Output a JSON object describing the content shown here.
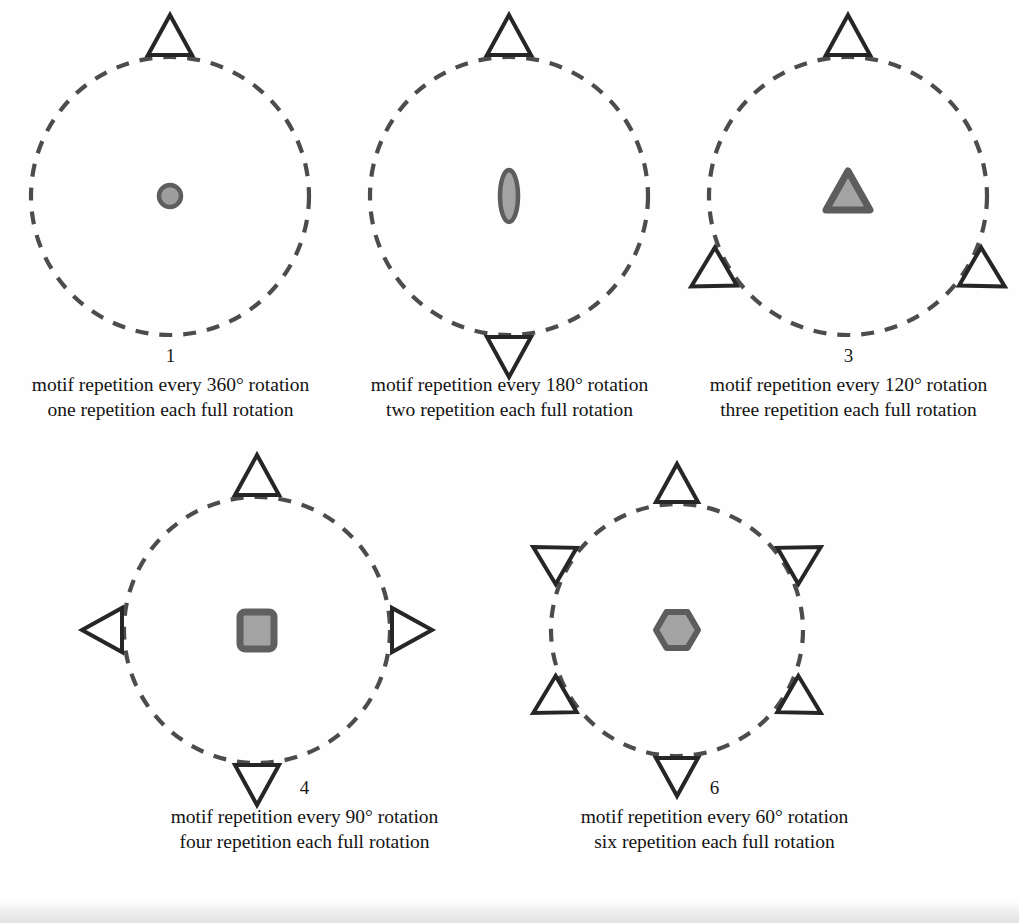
{
  "figure": {
    "palette": {
      "page_background": "#fefefe",
      "circle_stroke": "#4c4c4c",
      "motif_outline": "#262626",
      "center_shape_fill": "#9e9e9e",
      "center_shape_stroke": "#5d5d5d",
      "caption_text": "#131313",
      "bottom_band": "#e3e3e3"
    },
    "geometry": {
      "dash_pattern": "13 11",
      "circle_stroke_width": 4.2,
      "motif_outline_width": 4.0
    }
  },
  "panels": [
    {
      "id": "panel-1",
      "index_label": "1",
      "center_motif": "circle",
      "center_motif_icon": "filled-circle-icon",
      "fold_count": 1,
      "rotation_step_deg": 360,
      "marker_angles_deg": [
        0
      ],
      "caption_line_1": "motif repetition every 360° rotation",
      "caption_line_2": "one repetition each full rotation"
    },
    {
      "id": "panel-2",
      "index_label": "2",
      "center_motif": "ellipse",
      "center_motif_icon": "filled-ellipse-icon",
      "fold_count": 2,
      "rotation_step_deg": 180,
      "marker_angles_deg": [
        0,
        180
      ],
      "caption_line_1": "motif repetition every 180° rotation",
      "caption_line_2": "two repetition each full rotation"
    },
    {
      "id": "panel-3",
      "index_label": "3",
      "center_motif": "triangle",
      "center_motif_icon": "filled-triangle-icon",
      "fold_count": 3,
      "rotation_step_deg": 120,
      "marker_angles_deg": [
        0,
        120,
        240
      ],
      "caption_line_1": "motif repetition every 120° rotation",
      "caption_line_2": "three repetition each full rotation"
    },
    {
      "id": "panel-4",
      "index_label": "4",
      "center_motif": "square",
      "center_motif_icon": "filled-square-icon",
      "fold_count": 4,
      "rotation_step_deg": 90,
      "marker_angles_deg": [
        0,
        90,
        180,
        270
      ],
      "caption_line_1": "motif repetition every 90° rotation",
      "caption_line_2": "four repetition each full rotation"
    },
    {
      "id": "panel-6",
      "index_label": "6",
      "center_motif": "hexagon",
      "center_motif_icon": "filled-hexagon-icon",
      "fold_count": 6,
      "rotation_step_deg": 60,
      "marker_angles_deg": [
        0,
        60,
        120,
        180,
        240,
        300
      ],
      "caption_line_1": "motif repetition every 60° rotation",
      "caption_line_2": "six repetition each full rotation"
    }
  ]
}
